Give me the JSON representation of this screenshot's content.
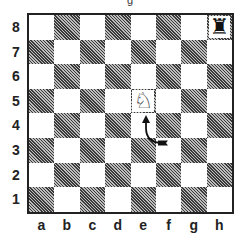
{
  "diagram": {
    "type": "chessboard",
    "top_fragment": "g",
    "ranks": [
      "8",
      "7",
      "6",
      "5",
      "4",
      "3",
      "2",
      "1"
    ],
    "files": [
      "a",
      "b",
      "c",
      "d",
      "e",
      "f",
      "g",
      "h"
    ],
    "pieces": [
      {
        "square": "h8",
        "piece": "rook",
        "color": "black",
        "icon": "black-rook-icon",
        "glyph": "♜"
      },
      {
        "square": "e5",
        "piece": "knight",
        "color": "white",
        "icon": "white-knight-icon",
        "glyph": "♘"
      }
    ],
    "arrows": [
      {
        "from": "f3",
        "to": "e4",
        "shape": "curved",
        "icon": "curved-arrow-icon"
      }
    ],
    "colors": {
      "border": "#222222",
      "light_square": "#ffffff",
      "dark_square_hatch": "#3a3a3a"
    }
  }
}
